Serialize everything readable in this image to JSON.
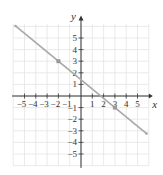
{
  "chart_data": {
    "type": "line",
    "title": "",
    "xlabel": "x",
    "ylabel": "y",
    "xlim": [
      -6,
      6
    ],
    "ylim": [
      -6,
      6.5
    ],
    "grid": true,
    "x_ticks": [
      -5,
      -4,
      -3,
      -2,
      -1,
      1,
      2,
      3,
      4,
      5
    ],
    "y_ticks": [
      -5,
      -4,
      -3,
      -2,
      -1,
      1,
      2,
      3,
      4,
      5
    ],
    "x_tick_labels": [
      "−5",
      "−4",
      "−3",
      "−2",
      "−1",
      "1",
      "2",
      "3",
      "4",
      "5"
    ],
    "y_tick_labels": [
      "−5",
      "−4",
      "−3",
      "−2",
      "−1",
      "1",
      "2",
      "3",
      "4",
      "5"
    ],
    "series": [
      {
        "name": "line",
        "equation": "y = -0.8x + 1.4",
        "x": [
          -5.8,
          5.8
        ],
        "y": [
          6.04,
          -3.24
        ]
      }
    ],
    "points": [
      {
        "x": -2,
        "y": 3
      },
      {
        "x": 3,
        "y": -1
      }
    ],
    "colors": {
      "line": "#a8a8a8",
      "points": "#999999",
      "grid": "#e4e4e4",
      "axes": "#333333"
    }
  }
}
